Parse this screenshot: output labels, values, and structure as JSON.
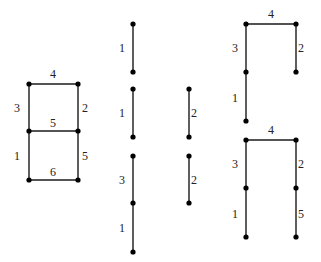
{
  "diagram": {
    "colors": {
      "edge": "#1a1a1a",
      "node": "#000000",
      "label": "#222222"
    },
    "graphs": [
      {
        "id": "ladder",
        "nodes": [
          [
            29,
            84
          ],
          [
            78,
            84
          ],
          [
            29,
            131
          ],
          [
            78,
            131
          ],
          [
            29,
            180
          ],
          [
            78,
            180
          ]
        ],
        "edges": [
          {
            "from": [
              29,
              84
            ],
            "to": [
              78,
              84
            ],
            "label": "4",
            "lx": 53,
            "ly": 78
          },
          {
            "from": [
              29,
              84
            ],
            "to": [
              29,
              131
            ],
            "label": "3",
            "lx": 17,
            "ly": 112
          },
          {
            "from": [
              78,
              84
            ],
            "to": [
              78,
              131
            ],
            "label": "2",
            "lx": 85,
            "ly": 112
          },
          {
            "from": [
              29,
              131
            ],
            "to": [
              78,
              131
            ],
            "label": "5",
            "lx": 53,
            "ly": 127
          },
          {
            "from": [
              29,
              131
            ],
            "to": [
              29,
              180
            ],
            "label": "1",
            "lx": 17,
            "ly": 160
          },
          {
            "from": [
              78,
              131
            ],
            "to": [
              78,
              180
            ],
            "label": "5",
            "lx": 85,
            "ly": 160
          },
          {
            "from": [
              29,
              180
            ],
            "to": [
              78,
              180
            ],
            "label": "6",
            "lx": 53,
            "ly": 176
          }
        ]
      },
      {
        "id": "mid-1",
        "nodes": [
          [
            133,
            24
          ],
          [
            133,
            72
          ]
        ],
        "edges": [
          {
            "from": [
              133,
              24
            ],
            "to": [
              133,
              72
            ],
            "label": "1",
            "lx": 122,
            "ly": 52
          }
        ]
      },
      {
        "id": "mid-2",
        "nodes": [
          [
            133,
            89
          ],
          [
            133,
            137
          ]
        ],
        "edges": [
          {
            "from": [
              133,
              89
            ],
            "to": [
              133,
              137
            ],
            "label": "1",
            "lx": 122,
            "ly": 117
          }
        ]
      },
      {
        "id": "mid-3",
        "nodes": [
          [
            189,
            89
          ],
          [
            189,
            137
          ]
        ],
        "edges": [
          {
            "from": [
              189,
              89
            ],
            "to": [
              189,
              137
            ],
            "label": "2",
            "lx": 194,
            "ly": 117
          }
        ]
      },
      {
        "id": "mid-4",
        "nodes": [
          [
            133,
            156
          ],
          [
            133,
            203
          ],
          [
            133,
            252
          ]
        ],
        "edges": [
          {
            "from": [
              133,
              156
            ],
            "to": [
              133,
              203
            ],
            "label": "3",
            "lx": 122,
            "ly": 184
          },
          {
            "from": [
              133,
              203
            ],
            "to": [
              133,
              252
            ],
            "label": "1",
            "lx": 122,
            "ly": 232
          }
        ]
      },
      {
        "id": "mid-5",
        "nodes": [
          [
            189,
            156
          ],
          [
            189,
            203
          ]
        ],
        "edges": [
          {
            "from": [
              189,
              156
            ],
            "to": [
              189,
              203
            ],
            "label": "2",
            "lx": 194,
            "ly": 184
          }
        ]
      },
      {
        "id": "right-top",
        "nodes": [
          [
            246,
            24
          ],
          [
            296,
            24
          ],
          [
            246,
            72
          ],
          [
            296,
            72
          ],
          [
            246,
            121
          ]
        ],
        "edges": [
          {
            "from": [
              246,
              24
            ],
            "to": [
              296,
              24
            ],
            "label": "4",
            "lx": 271,
            "ly": 18
          },
          {
            "from": [
              246,
              24
            ],
            "to": [
              246,
              72
            ],
            "label": "3",
            "lx": 235,
            "ly": 52
          },
          {
            "from": [
              296,
              24
            ],
            "to": [
              296,
              72
            ],
            "label": "2",
            "lx": 301,
            "ly": 52
          },
          {
            "from": [
              246,
              72
            ],
            "to": [
              246,
              121
            ],
            "label": "1",
            "lx": 235,
            "ly": 102
          }
        ]
      },
      {
        "id": "right-bottom",
        "nodes": [
          [
            246,
            140
          ],
          [
            296,
            140
          ],
          [
            246,
            188
          ],
          [
            296,
            188
          ],
          [
            246,
            237
          ],
          [
            296,
            237
          ]
        ],
        "edges": [
          {
            "from": [
              246,
              140
            ],
            "to": [
              296,
              140
            ],
            "label": "4",
            "lx": 271,
            "ly": 134
          },
          {
            "from": [
              246,
              140
            ],
            "to": [
              246,
              188
            ],
            "label": "3",
            "lx": 235,
            "ly": 168
          },
          {
            "from": [
              296,
              140
            ],
            "to": [
              296,
              188
            ],
            "label": "2",
            "lx": 301,
            "ly": 168
          },
          {
            "from": [
              246,
              188
            ],
            "to": [
              246,
              237
            ],
            "label": "1",
            "lx": 235,
            "ly": 218
          },
          {
            "from": [
              296,
              188
            ],
            "to": [
              296,
              237
            ],
            "label": "5",
            "lx": 301,
            "ly": 218
          }
        ]
      }
    ]
  }
}
